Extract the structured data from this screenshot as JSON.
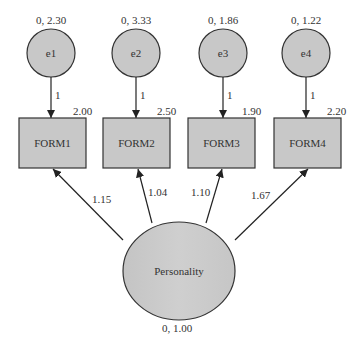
{
  "diagram": {
    "type": "structural-equation-model",
    "colors": {
      "fill": "#c8c8c8",
      "stroke": "#333333",
      "text": "#333333"
    },
    "errors": [
      {
        "id": "e1",
        "label": "e1",
        "params": "0, 2.30",
        "path": "1"
      },
      {
        "id": "e2",
        "label": "e2",
        "params": "0, 3.33",
        "path": "1"
      },
      {
        "id": "e3",
        "label": "e3",
        "params": "0, 1.86",
        "path": "1"
      },
      {
        "id": "e4",
        "label": "e4",
        "params": "0, 1.22",
        "path": "1"
      }
    ],
    "indicators": [
      {
        "id": "FORM1",
        "label": "FORM1",
        "intercept": "2.00",
        "loading": "1.15"
      },
      {
        "id": "FORM2",
        "label": "FORM2",
        "intercept": "2.50",
        "loading": "1.04"
      },
      {
        "id": "FORM3",
        "label": "FORM3",
        "intercept": "1.90",
        "loading": "1.10"
      },
      {
        "id": "FORM4",
        "label": "FORM4",
        "intercept": "2.20",
        "loading": "1.67"
      }
    ],
    "latent": {
      "label": "Personality",
      "params": "0, 1.00"
    }
  }
}
